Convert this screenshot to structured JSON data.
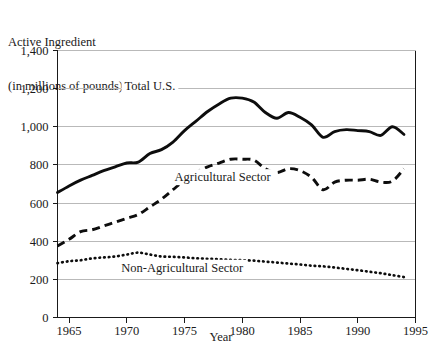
{
  "chart_data": {
    "type": "line",
    "title": "",
    "ylabel": "Active Ingredient\n(in millions of pounds)",
    "ylabel_line1": "Active Ingredient",
    "ylabel_line2": "(in millions of pounds)",
    "xlabel": "Year",
    "xlim": [
      1964,
      1995
    ],
    "ylim": [
      0,
      1400
    ],
    "grid": true,
    "legend_position": "inline-annotations",
    "ytick_labels": [
      "0",
      "200",
      "400",
      "600",
      "800",
      "1,000",
      "1,200",
      "1,400"
    ],
    "ytick_values": [
      0,
      200,
      400,
      600,
      800,
      1000,
      1200,
      1400
    ],
    "xtick_labels": [
      "1965",
      "1970",
      "1975",
      "1980",
      "1985",
      "1990",
      "1995"
    ],
    "xtick_values": [
      1965,
      1970,
      1975,
      1980,
      1985,
      1990,
      1995
    ],
    "x": [
      1964,
      1965,
      1966,
      1967,
      1968,
      1969,
      1970,
      1971,
      1972,
      1973,
      1974,
      1975,
      1976,
      1977,
      1978,
      1979,
      1980,
      1981,
      1982,
      1983,
      1984,
      1985,
      1986,
      1987,
      1988,
      1989,
      1990,
      1991,
      1992,
      1993,
      1994
    ],
    "series": [
      {
        "name": "Total U.S.",
        "style": "solid",
        "color": "#0d0d0d",
        "values": [
          655,
          690,
          720,
          745,
          770,
          790,
          810,
          815,
          860,
          880,
          920,
          980,
          1030,
          1080,
          1120,
          1150,
          1150,
          1130,
          1075,
          1045,
          1075,
          1050,
          1010,
          945,
          975,
          985,
          980,
          975,
          955,
          1000,
          960
        ]
      },
      {
        "name": "Agricultural Sector",
        "style": "dashed",
        "color": "#0d0d0d",
        "values": [
          375,
          410,
          450,
          460,
          480,
          500,
          520,
          540,
          580,
          620,
          670,
          720,
          760,
          790,
          810,
          830,
          830,
          825,
          780,
          760,
          780,
          770,
          735,
          670,
          710,
          720,
          720,
          725,
          710,
          715,
          780
        ]
      },
      {
        "name": "Non-Agricultural Sector",
        "style": "dotted",
        "color": "#0d0d0d",
        "values": [
          285,
          295,
          300,
          310,
          315,
          320,
          330,
          340,
          330,
          320,
          318,
          315,
          310,
          308,
          305,
          302,
          300,
          298,
          293,
          288,
          283,
          278,
          272,
          268,
          262,
          255,
          248,
          240,
          232,
          222,
          212
        ]
      }
    ],
    "annotations": [
      {
        "text": "Total U.S.",
        "x": 1972.0,
        "y": 1195
      },
      {
        "text": "Agricultural Sector",
        "x": 1978.3,
        "y": 715
      },
      {
        "text": "Non-Agricultural Sector",
        "x": 1974.8,
        "y": 240
      }
    ]
  }
}
